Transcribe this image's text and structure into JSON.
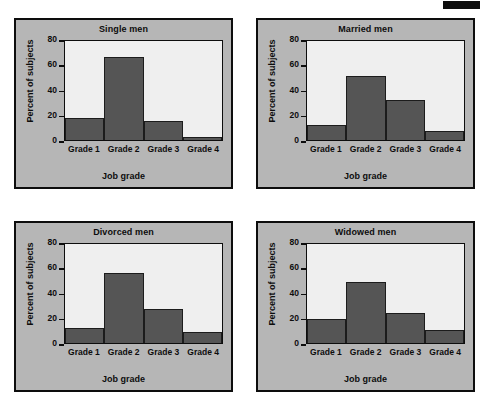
{
  "figure": {
    "artifact_label": "scan-artifact-bar",
    "panel_bg_color": "#b6b6b6",
    "plot_bg_color": "#efefef",
    "bar_color": "#555555",
    "border_color": "#0d0d0d"
  },
  "chart_data": [
    {
      "type": "bar",
      "title": "Single men",
      "xlabel": "Job grade",
      "ylabel": "Percent of subjects",
      "categories": [
        "Grade 1",
        "Grade 2",
        "Grade 3",
        "Grade 4"
      ],
      "values": [
        17.5,
        67,
        15.5,
        2.5
      ],
      "ylim": [
        0,
        80
      ],
      "yticks": [
        0,
        20,
        40,
        60,
        80
      ],
      "ytick_labels": [
        "0",
        "20",
        "40",
        "60",
        "80"
      ],
      "grid": false,
      "legend": "none"
    },
    {
      "type": "bar",
      "title": "Married men",
      "xlabel": "Job grade",
      "ylabel": "Percent of subjects",
      "categories": [
        "Grade 1",
        "Grade 2",
        "Grade 3",
        "Grade 4"
      ],
      "values": [
        12,
        51.5,
        32,
        7.5
      ],
      "ylim": [
        0,
        80
      ],
      "yticks": [
        0,
        20,
        40,
        60,
        80
      ],
      "ytick_labels": [
        "0",
        "20",
        "40",
        "60",
        "80"
      ],
      "grid": false,
      "legend": "none"
    },
    {
      "type": "bar",
      "title": "Divorced men",
      "xlabel": "Job grade",
      "ylabel": "Percent of subjects",
      "categories": [
        "Grade 1",
        "Grade 2",
        "Grade 3",
        "Grade 4"
      ],
      "values": [
        12,
        56.5,
        27.5,
        9
      ],
      "ylim": [
        0,
        80
      ],
      "yticks": [
        0,
        20,
        40,
        60,
        80
      ],
      "ytick_labels": [
        "0",
        "20",
        "40",
        "60",
        "80"
      ],
      "grid": false,
      "legend": "none"
    },
    {
      "type": "bar",
      "title": "Widowed men",
      "xlabel": "Job grade",
      "ylabel": "Percent of subjects",
      "categories": [
        "Grade 1",
        "Grade 2",
        "Grade 3",
        "Grade 4"
      ],
      "values": [
        19.5,
        49,
        24.5,
        10.5
      ],
      "ylim": [
        0,
        80
      ],
      "yticks": [
        0,
        20,
        40,
        60,
        80
      ],
      "ytick_labels": [
        "0",
        "20",
        "40",
        "60",
        "80"
      ],
      "grid": false,
      "legend": "none"
    }
  ]
}
